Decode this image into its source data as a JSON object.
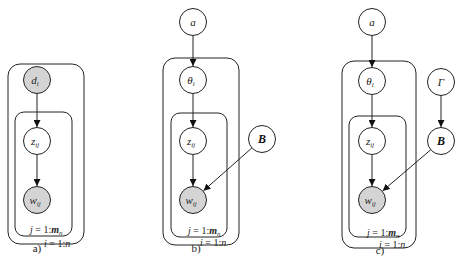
{
  "colors": {
    "observed_fill": "#d4d4d4",
    "latent_fill": "#ffffff",
    "stroke": "#222222"
  },
  "panels": [
    {
      "caption": "a)",
      "nodes": [
        {
          "id": "d",
          "base": "d",
          "sub": "i",
          "observed": true
        },
        {
          "id": "z",
          "base": "z",
          "sub": "ij",
          "observed": false
        },
        {
          "id": "w",
          "base": "w",
          "sub": "ij",
          "observed": true
        }
      ],
      "edges": [
        [
          "d",
          "z"
        ],
        [
          "z",
          "w"
        ]
      ],
      "plates": {
        "inner": "j = 1:m",
        "inner_sub": "n",
        "outer": "i = 1:n"
      }
    },
    {
      "caption": "b)",
      "nodes": [
        {
          "id": "a",
          "base": "a",
          "sub": "",
          "observed": false
        },
        {
          "id": "theta",
          "base": "θ",
          "sub": "i",
          "observed": false
        },
        {
          "id": "z",
          "base": "z",
          "sub": "ij",
          "observed": false
        },
        {
          "id": "w",
          "base": "w",
          "sub": "ij",
          "observed": true
        },
        {
          "id": "B",
          "base": "B",
          "sub": "",
          "observed": false
        }
      ],
      "edges": [
        [
          "a",
          "theta"
        ],
        [
          "theta",
          "z"
        ],
        [
          "z",
          "w"
        ],
        [
          "B",
          "w"
        ]
      ],
      "plates": {
        "inner": "j = 1:m",
        "inner_sub": "n",
        "outer": "i = 1:n"
      }
    },
    {
      "caption": "c)",
      "nodes": [
        {
          "id": "a",
          "base": "a",
          "sub": "",
          "observed": false
        },
        {
          "id": "theta",
          "base": "θ",
          "sub": "i",
          "observed": false
        },
        {
          "id": "z",
          "base": "z",
          "sub": "ij",
          "observed": false
        },
        {
          "id": "w",
          "base": "w",
          "sub": "ij",
          "observed": true
        },
        {
          "id": "Gamma",
          "base": "Γ",
          "sub": "",
          "observed": false
        },
        {
          "id": "B",
          "base": "B",
          "sub": "",
          "observed": false
        }
      ],
      "edges": [
        [
          "a",
          "theta"
        ],
        [
          "theta",
          "z"
        ],
        [
          "z",
          "w"
        ],
        [
          "Gamma",
          "B"
        ],
        [
          "B",
          "w"
        ]
      ],
      "plates": {
        "inner": "j = 1:m",
        "inner_sub": "n",
        "outer": "i = 1:n"
      }
    }
  ]
}
